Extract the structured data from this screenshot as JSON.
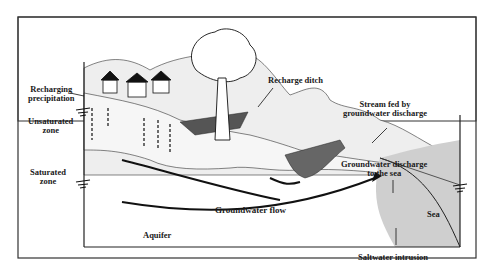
{
  "diagram": {
    "title": "",
    "labels": {
      "recharging_precipitation_line1": "Recharging",
      "recharging_precipitation_line2": "precipitation",
      "unsaturated_zone_line1": "Unsaturated",
      "unsaturated_zone_line2": "zone",
      "saturated_zone_line1": "Saturated",
      "saturated_zone_line2": "zone",
      "recharge_ditch": "Recharge ditch",
      "stream_fed_line1": "Stream fed by",
      "stream_fed_line2": "groundwater discharge",
      "gw_discharge_sea_line1": "Groundwater discharge",
      "gw_discharge_sea_line2": "to the sea",
      "groundwater_flow": "Groundwater flow",
      "aquifer": "Aquifer",
      "sea": "Sea",
      "saltwater_intrusion": "Saltwater intrusion"
    },
    "elements": [
      "houses",
      "tree",
      "hills",
      "recharge-ditch",
      "stream",
      "sea",
      "flow-arrows",
      "water-table-symbols"
    ],
    "colors": {
      "line": "#1a1a1a",
      "hill_fill": "#ececec",
      "sea_fill": "#c8c8c8",
      "ditch_fill": "#555555",
      "background": "#ffffff"
    }
  }
}
